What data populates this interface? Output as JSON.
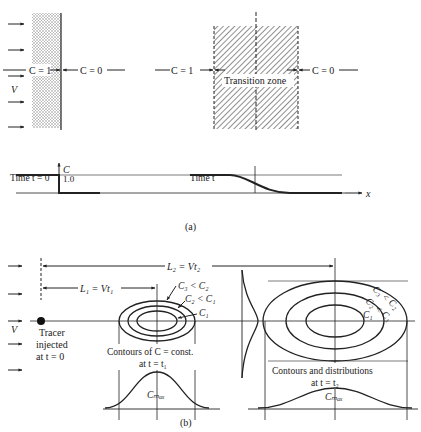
{
  "panel_a": {
    "left_block": {
      "label_c1": "C = 1",
      "label_c0": "C = 0",
      "velocity_label": "V"
    },
    "right_block": {
      "label_c1": "C = 1",
      "label_c0": "C = 0",
      "zone_label": "Transition zone"
    },
    "profile": {
      "axis_y_label": "C",
      "axis_x_label": "x",
      "y_tick": "1.0",
      "time0_label": "Time t = 0",
      "time_label": "Time t"
    },
    "caption": "(a)"
  },
  "panel_b": {
    "velocity_label": "V",
    "L2_label": "L₂ = Vt₂",
    "L1_label": "L₁ = Vt₁",
    "tracer_label_1": "Tracer",
    "tracer_label_2": "injected",
    "tracer_label_3": "at t = 0",
    "contour1": {
      "c3": "C₃ < C₂",
      "c2": "C₂ < C₁",
      "c1": "C₁",
      "caption_1": "Contours of C = const.",
      "caption_2": "at t = t₁",
      "cmax": "Cₘₐₓ"
    },
    "contour2": {
      "c3": "C₃ < C₂",
      "c2": "C₂ < C₁",
      "c1": "C₁",
      "caption_1": "Contours and distributions",
      "caption_2": "at t = t₂",
      "cmax": "Cₘₐₓ"
    },
    "caption": "(b)"
  }
}
